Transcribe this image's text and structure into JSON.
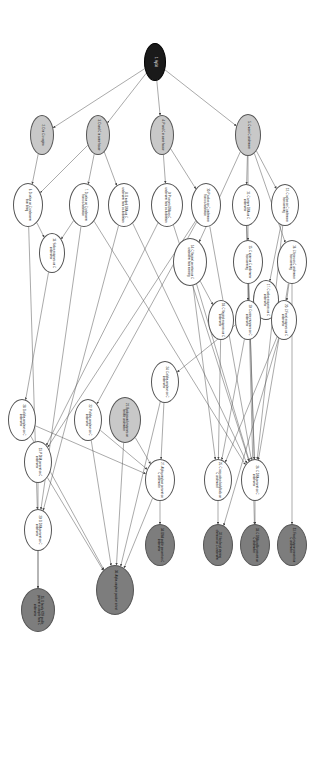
{
  "diagram": {
    "type": "directed-acyclic-graph",
    "orientation": "rotated-90-clockwise",
    "canvas": {
      "width": 784,
      "height": 310
    },
    "palette": {
      "root_node": "#1a1a1a",
      "intermediate_shaded": "#c8c8c8",
      "evidence_dark": "#7d7d7d",
      "plain_node": "#ffffff",
      "edge": "#555555",
      "background": "#ffffff"
    },
    "legend_note": "",
    "nodes": [
      {
        "id": 1,
        "label": "1. Hg/3d",
        "x": 62,
        "y": 155,
        "rx": 19,
        "ry": 11,
        "fill": "fill-black"
      },
      {
        "id": 2,
        "label": "2. D in C's vagina",
        "x": 135,
        "y": 268,
        "rx": 20,
        "ry": 12,
        "fill": "fill-light"
      },
      {
        "id": 3,
        "label": "3. D and C in same house",
        "x": 135,
        "y": 212,
        "rx": 20,
        "ry": 12,
        "fill": "fill-light"
      },
      {
        "id": 4,
        "label": "4. P and C in same house",
        "x": 135,
        "y": 148,
        "rx": 20,
        "ry": 12,
        "fill": "fill-light"
      },
      {
        "id": 5,
        "label": "5. C worn C underwear",
        "x": 135,
        "y": 62,
        "rx": 21,
        "ry": 13,
        "fill": "fill-light"
      },
      {
        "id": 6,
        "label": "6. D saliva on C underwear from biting",
        "x": 205,
        "y": 282,
        "rx": 22,
        "ry": 15,
        "fill": "fill-white"
      },
      {
        "id": 7,
        "label": "7. D saliva on C underwear from co-habitation",
        "x": 205,
        "y": 226,
        "rx": 22,
        "ry": 15,
        "fill": "fill-white"
      },
      {
        "id": 8,
        "label": "8. D naked DNA on C underwear from co-habitation",
        "x": 205,
        "y": 186,
        "rx": 22,
        "ry": 16,
        "fill": "fill-white"
      },
      {
        "id": 9,
        "label": "9. P semen DNA on C underwear from co-habitation",
        "x": 205,
        "y": 143,
        "rx": 22,
        "ry": 16,
        "fill": "fill-white"
      },
      {
        "id": 10,
        "label": "10. P saliva on C underwear from co-habitation",
        "x": 205,
        "y": 104,
        "rx": 22,
        "ry": 15,
        "fill": "fill-white"
      },
      {
        "id": 11,
        "label": "11. C semen DNA on C underwear",
        "x": 205,
        "y": 64,
        "rx": 21,
        "ry": 14,
        "fill": "fill-white"
      },
      {
        "id": 12,
        "label": "12. C saliva on C underwear from wearing",
        "x": 205,
        "y": 25,
        "rx": 21,
        "ry": 14,
        "fill": "fill-white"
      },
      {
        "id": 13,
        "label": "13. Saliva enzymes on C underwear",
        "x": 253,
        "y": 258,
        "rx": 20,
        "ry": 13,
        "fill": "fill-white"
      },
      {
        "id": 14,
        "label": "14. C Vaginal secretion on C underwear from wearing",
        "x": 262,
        "y": 120,
        "rx": 24,
        "ry": 17,
        "fill": "fill-white"
      },
      {
        "id": 15,
        "label": "15. C urine on C underwear from wearing",
        "x": 262,
        "y": 62,
        "rx": 22,
        "ry": 15,
        "fill": "fill-white"
      },
      {
        "id": 16,
        "label": "16. C feces on C underwear from wearing",
        "x": 262,
        "y": 18,
        "rx": 22,
        "ry": 15,
        "fill": "fill-white"
      },
      {
        "id": 17,
        "label": "17. C saliva enzymes on C underwear",
        "x": 300,
        "y": 44,
        "rx": 20,
        "ry": 13,
        "fill": "fill-white"
      },
      {
        "id": 18,
        "label": "18. C Vaginal enzymes on C underwear",
        "x": 320,
        "y": 89,
        "rx": 20,
        "ry": 13,
        "fill": "fill-white"
      },
      {
        "id": 19,
        "label": "19. C urine enzymes on C underwear",
        "x": 320,
        "y": 62,
        "rx": 20,
        "ry": 13,
        "fill": "fill-white"
      },
      {
        "id": 20,
        "label": "20. C Fecal enzymes on C underwear",
        "x": 320,
        "y": 26,
        "rx": 20,
        "ry": 13,
        "fill": "fill-white"
      },
      {
        "id": 21,
        "label": "21. Background enzymes on female underwear",
        "x": 420,
        "y": 185,
        "rx": 23,
        "ry": 16,
        "fill": "fill-light"
      },
      {
        "id": 22,
        "label": "22. P alpha-amylase on C underwear",
        "x": 420,
        "y": 222,
        "rx": 21,
        "ry": 14,
        "fill": "fill-white"
      },
      {
        "id": 23,
        "label": "23. P DNA present on C underwear",
        "x": 462,
        "y": 272,
        "rx": 21,
        "ry": 14,
        "fill": "fill-white"
      },
      {
        "id": 24,
        "label": "24. C alpha-amylase on C underwear",
        "x": 382,
        "y": 145,
        "rx": 21,
        "ry": 14,
        "fill": "fill-white"
      },
      {
        "id": 25,
        "label": "25. C non-saliva bodyfluids on C underwear",
        "x": 480,
        "y": 92,
        "rx": 21,
        "ry": 14,
        "fill": "fill-white"
      },
      {
        "id": 26,
        "label": "26. C DNA present on C underwear",
        "x": 480,
        "y": 55,
        "rx": 21,
        "ry": 14,
        "fill": "fill-white"
      },
      {
        "id": 27,
        "label": "27. Alpha-amylase present on C underwear",
        "x": 480,
        "y": 150,
        "rx": 21,
        "ry": 15,
        "fill": "fill-white"
      },
      {
        "id": 28,
        "label": "28. D alpha-amylase on C underwear",
        "x": 420,
        "y": 288,
        "rx": 21,
        "ry": 14,
        "fill": "fill-white"
      },
      {
        "id": 29,
        "label": "29. D DNA present on C underwear",
        "x": 530,
        "y": 272,
        "rx": 21,
        "ry": 14,
        "fill": "fill-white"
      },
      {
        "id": 30,
        "label": "30. Alpha-amylase positive in test",
        "x": 590,
        "y": 195,
        "rx": 25,
        "ry": 19,
        "fill": "fill-dark"
      },
      {
        "id": 31,
        "label": "31. Fecal enzyme present on C underwear",
        "x": 545,
        "y": 18,
        "rx": 21,
        "ry": 15,
        "fill": "fill-dark"
      },
      {
        "id": 32,
        "label": "32. Non-fecal staining chemical on C underwear",
        "x": 545,
        "y": 92,
        "rx": 21,
        "ry": 15,
        "fill": "fill-dark"
      },
      {
        "id": 33,
        "label": "33. C DNA profile present on C underwear",
        "x": 545,
        "y": 55,
        "rx": 21,
        "ry": 15,
        "fill": "fill-dark"
      },
      {
        "id": 34,
        "label": "34. DNA profile present on C underwear",
        "x": 545,
        "y": 150,
        "rx": 21,
        "ry": 15,
        "fill": "fill-dark"
      },
      {
        "id": 35,
        "label": "35. D family STR profile present in sample from C underwear",
        "x": 610,
        "y": 272,
        "rx": 22,
        "ry": 17,
        "fill": "fill-dark"
      }
    ],
    "edges": [
      {
        "from": 1,
        "to": 2
      },
      {
        "from": 1,
        "to": 3
      },
      {
        "from": 1,
        "to": 4
      },
      {
        "from": 1,
        "to": 5
      },
      {
        "from": 2,
        "to": 6
      },
      {
        "from": 3,
        "to": 7
      },
      {
        "from": 3,
        "to": 8
      },
      {
        "from": 3,
        "to": 6
      },
      {
        "from": 4,
        "to": 9
      },
      {
        "from": 4,
        "to": 10
      },
      {
        "from": 5,
        "to": 11
      },
      {
        "from": 5,
        "to": 12
      },
      {
        "from": 5,
        "to": 14
      },
      {
        "from": 5,
        "to": 15
      },
      {
        "from": 5,
        "to": 16
      },
      {
        "from": 6,
        "to": 13
      },
      {
        "from": 7,
        "to": 13
      },
      {
        "from": 6,
        "to": 29
      },
      {
        "from": 7,
        "to": 29
      },
      {
        "from": 8,
        "to": 29
      },
      {
        "from": 9,
        "to": 23
      },
      {
        "from": 10,
        "to": 22
      },
      {
        "from": 10,
        "to": 23
      },
      {
        "from": 11,
        "to": 26
      },
      {
        "from": 12,
        "to": 17
      },
      {
        "from": 14,
        "to": 18
      },
      {
        "from": 14,
        "to": 26
      },
      {
        "from": 14,
        "to": 25
      },
      {
        "from": 15,
        "to": 19
      },
      {
        "from": 16,
        "to": 20
      },
      {
        "from": 16,
        "to": 31
      },
      {
        "from": 17,
        "to": 24
      },
      {
        "from": 18,
        "to": 25
      },
      {
        "from": 19,
        "to": 25
      },
      {
        "from": 20,
        "to": 32
      },
      {
        "from": 20,
        "to": 25
      },
      {
        "from": 13,
        "to": 28
      },
      {
        "from": 21,
        "to": 27
      },
      {
        "from": 22,
        "to": 27
      },
      {
        "from": 24,
        "to": 27
      },
      {
        "from": 28,
        "to": 27
      },
      {
        "from": 21,
        "to": 30
      },
      {
        "from": 22,
        "to": 30
      },
      {
        "from": 24,
        "to": 30
      },
      {
        "from": 27,
        "to": 30
      },
      {
        "from": 28,
        "to": 30
      },
      {
        "from": 23,
        "to": 30
      },
      {
        "from": 25,
        "to": 32
      },
      {
        "from": 26,
        "to": 33
      },
      {
        "from": 27,
        "to": 34
      },
      {
        "from": 23,
        "to": 35
      },
      {
        "from": 29,
        "to": 35
      },
      {
        "from": 12,
        "to": 26
      },
      {
        "from": 11,
        "to": 33
      },
      {
        "from": 15,
        "to": 26
      },
      {
        "from": 16,
        "to": 26
      },
      {
        "from": 10,
        "to": 26
      },
      {
        "from": 9,
        "to": 26
      },
      {
        "from": 8,
        "to": 26
      },
      {
        "from": 7,
        "to": 26
      }
    ]
  }
}
